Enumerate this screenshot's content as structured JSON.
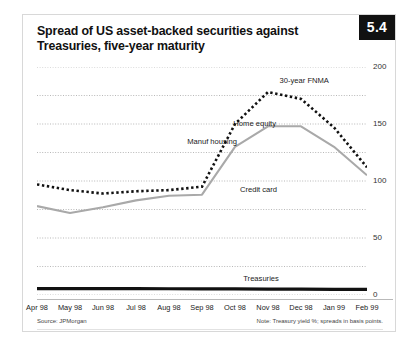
{
  "figure": {
    "number": "5.4",
    "title_line1": "Spread of US asset-backed securities against",
    "title_line2": "Treasuries, five-year maturity",
    "source": "Source: JPMorgan",
    "note": "Note: Treasury yield %; spreads in basis points."
  },
  "chart_data": {
    "type": "line",
    "title": "Spread of US asset-backed securities against Treasuries, five-year maturity",
    "xlabel": "",
    "ylabel": "",
    "ylim": [
      0,
      200
    ],
    "yticks": [
      0,
      25,
      50,
      75,
      100,
      125,
      150,
      175,
      200
    ],
    "ytick_labels": [
      "0",
      "",
      "50",
      "",
      "100",
      "",
      "150",
      "",
      "200"
    ],
    "grid": "horizontal-dotted",
    "legend": "inline-annotations",
    "categories": [
      "Apr 98",
      "May 98",
      "Jun 98",
      "Jul 98",
      "Aug 98",
      "Sep 98",
      "Oct 98",
      "Nov 98",
      "Dec 98",
      "Jan 99",
      "Feb 99"
    ],
    "series": [
      {
        "name": "Home equity",
        "style": "dotted-black",
        "color": "#111111",
        "values": [
          97,
          92,
          89,
          91,
          92,
          95,
          150,
          178,
          172,
          147,
          112
        ]
      },
      {
        "name": "Manuf housing",
        "style": "solid-gray",
        "color": "#a9a9a9",
        "values": [
          78,
          72,
          77,
          83,
          87,
          88,
          130,
          148,
          148,
          130,
          105
        ]
      },
      {
        "name": "Treasuries",
        "style": "solid-thick-black",
        "color": "#111111",
        "values": [
          5.6,
          5.6,
          5.6,
          5.6,
          5.5,
          5.4,
          5.3,
          5.2,
          5.1,
          5.0,
          5.0
        ]
      }
    ],
    "annotations": [
      {
        "label": "30-year FNMA",
        "x": 7.35,
        "y": 188
      },
      {
        "label": "Home equity",
        "x": 5.95,
        "y": 150
      },
      {
        "label": "Manuf housing",
        "x": 4.55,
        "y": 134
      },
      {
        "label": "Credit card",
        "x": 6.15,
        "y": 92
      },
      {
        "label": "Treasuries",
        "x": 6.25,
        "y": 14
      }
    ]
  }
}
